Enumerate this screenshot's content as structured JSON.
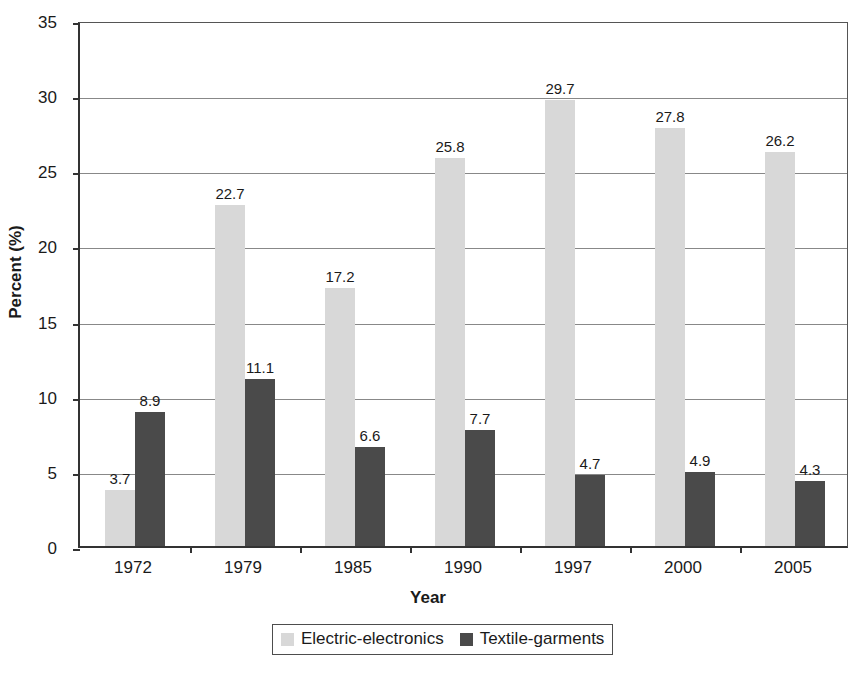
{
  "chart_data": {
    "type": "bar",
    "title": "",
    "subtitle": "",
    "xlabel": "Year",
    "ylabel": "Percent (%)",
    "categories": [
      "1972",
      "1979",
      "1985",
      "1990",
      "1997",
      "2000",
      "2005"
    ],
    "series": [
      {
        "name": "Electric-electronics",
        "color": "#d8d8d8",
        "values": [
          3.7,
          22.7,
          17.2,
          25.8,
          29.7,
          27.8,
          26.2
        ]
      },
      {
        "name": "Textile-garments",
        "color": "#4a4a4a",
        "values": [
          8.9,
          11.1,
          6.6,
          7.7,
          4.7,
          4.9,
          4.3
        ]
      }
    ],
    "ylim": [
      0,
      35
    ],
    "yticks": [
      0,
      5,
      10,
      15,
      20,
      25,
      30,
      35
    ],
    "ytick_labels": [
      "0",
      "5",
      "10",
      "15",
      "20",
      "25",
      "30",
      "35"
    ],
    "grid": true,
    "grid_axis": "y",
    "legend_position": "bottom",
    "data_labels": true,
    "data_label_format": "one-decimal"
  },
  "axes": {
    "y_title": "Percent (%)",
    "x_title": "Year"
  },
  "legend": {
    "items": [
      {
        "label": "Electric-electronics",
        "color": "#d8d8d8"
      },
      {
        "label": "Textile-garments",
        "color": "#4a4a4a"
      }
    ]
  }
}
